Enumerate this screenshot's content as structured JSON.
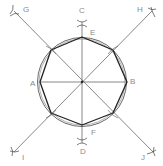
{
  "diagram": {
    "type": "geometric-construction",
    "colors": {
      "line": "#555555",
      "octagon": "#222222",
      "circle": "#444444",
      "label": "#8a8a8a"
    },
    "center": {
      "x": 82,
      "y": 82
    },
    "circle_radius": 44,
    "labels": {
      "A": "A",
      "B": "B",
      "C": "C",
      "D": "D",
      "E": "E",
      "F": "F",
      "G": "G",
      "H": "H",
      "I": "I",
      "J": "J"
    },
    "lines": [
      {
        "name": "A-B",
        "from": [
          40,
          82
        ],
        "to": [
          127,
          82
        ]
      },
      {
        "name": "C-D",
        "from": [
          82,
          22
        ],
        "to": [
          82,
          143
        ]
      },
      {
        "name": "G-J",
        "from": [
          14,
          11
        ],
        "to": [
          153,
          152
        ]
      },
      {
        "name": "H-I",
        "from": [
          152,
          11
        ],
        "to": [
          14,
          152
        ]
      }
    ],
    "octagon_vertices": [
      [
        82,
        37
      ],
      [
        113,
        50
      ],
      [
        127,
        82
      ],
      [
        113,
        113
      ],
      [
        82,
        125
      ],
      [
        51,
        113
      ],
      [
        40,
        82
      ],
      [
        51,
        50
      ]
    ]
  }
}
